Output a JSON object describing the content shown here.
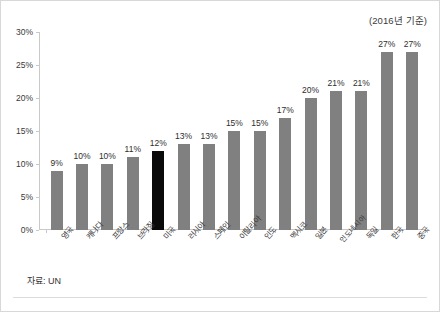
{
  "annotation": {
    "top_right": "(2016년 기준)",
    "source": "자료: UN"
  },
  "chart_data": {
    "type": "bar",
    "title": "",
    "subtitle": "(2016년 기준)",
    "xlabel": "",
    "ylabel": "",
    "ylim": [
      0,
      30
    ],
    "yticks": [
      0,
      5,
      10,
      15,
      20,
      25,
      30
    ],
    "ytick_labels": [
      "0%",
      "5%",
      "10%",
      "15%",
      "20%",
      "25%",
      "30%"
    ],
    "grid": false,
    "legend": "none",
    "source": "자료: UN",
    "categories": [
      "영국",
      "캐나다",
      "프랑스",
      "브라질",
      "미국",
      "러시아",
      "스페인",
      "이탈리아",
      "인도",
      "멕시코",
      "일본",
      "인도네시아",
      "독일",
      "한국",
      "중국"
    ],
    "values": [
      9,
      10,
      10,
      11,
      12,
      13,
      13,
      15,
      15,
      17,
      20,
      21,
      21,
      27,
      27
    ],
    "value_labels": [
      "9%",
      "10%",
      "10%",
      "11%",
      "12%",
      "13%",
      "13%",
      "15%",
      "15%",
      "17%",
      "20%",
      "21%",
      "21%",
      "27%",
      "27%"
    ],
    "bar_colors": [
      "#808080",
      "#808080",
      "#808080",
      "#808080",
      "#0a0a0a",
      "#808080",
      "#808080",
      "#808080",
      "#808080",
      "#808080",
      "#808080",
      "#808080",
      "#808080",
      "#808080",
      "#808080"
    ],
    "highlight_index": 4,
    "highlight_color": "#0a0a0a",
    "default_color": "#808080"
  }
}
